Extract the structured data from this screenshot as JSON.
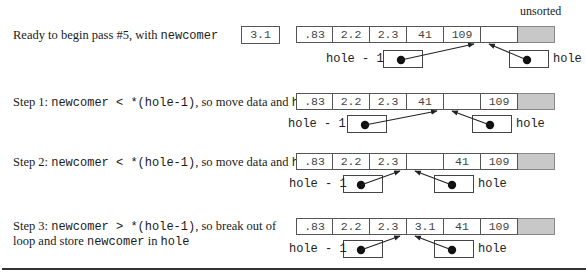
{
  "header": {
    "unsorted_label": "unsorted"
  },
  "newcomer_value": "3.1",
  "steps": [
    {
      "caption_parts": [
        {
          "text": "Ready to begin pass #5, with ",
          "mono": false
        },
        {
          "text": "newcomer",
          "mono": true
        }
      ],
      "caption_line2": [],
      "cells": [
        ".83",
        "2.2",
        "2.3",
        "41",
        "109",
        ""
      ],
      "hole_minus_1_label": "hole - 1",
      "hole_label": "hole",
      "hole_minus_1_target_index": 4,
      "hole_target_index": 5
    },
    {
      "caption_parts": [
        {
          "text": "Step 1: ",
          "mono": false
        },
        {
          "text": "newcomer < *(hole-1)",
          "mono": true
        },
        {
          "text": ", so move data and ",
          "mono": false
        },
        {
          "text": "hole",
          "mono": true
        }
      ],
      "caption_line2": [],
      "cells": [
        ".83",
        "2.2",
        "2.3",
        "41",
        "",
        "109"
      ],
      "hole_minus_1_label": "hole - 1",
      "hole_label": "hole",
      "hole_minus_1_target_index": 3,
      "hole_target_index": 4
    },
    {
      "caption_parts": [
        {
          "text": "Step 2: ",
          "mono": false
        },
        {
          "text": "newcomer < *(hole-1)",
          "mono": true
        },
        {
          "text": ", so move data and ",
          "mono": false
        },
        {
          "text": "hole",
          "mono": true
        }
      ],
      "caption_line2": [],
      "cells": [
        ".83",
        "2.2",
        "2.3",
        "",
        "41",
        "109"
      ],
      "hole_minus_1_label": "hole - 1",
      "hole_label": "hole",
      "hole_minus_1_target_index": 2,
      "hole_target_index": 3
    },
    {
      "caption_parts": [
        {
          "text": "Step 3: ",
          "mono": false
        },
        {
          "text": "newcomer > *(hole-1)",
          "mono": true
        },
        {
          "text": ", so break out of",
          "mono": false
        }
      ],
      "caption_line2": [
        {
          "text": "loop and store ",
          "mono": false
        },
        {
          "text": "newcomer",
          "mono": true
        },
        {
          "text": " in ",
          "mono": false
        },
        {
          "text": "hole",
          "mono": true
        }
      ],
      "cells": [
        ".83",
        "2.2",
        "2.3",
        "3.1",
        "41",
        "109"
      ],
      "hole_minus_1_label": "hole - 1",
      "hole_label": "hole",
      "hole_minus_1_target_index": 2,
      "hole_target_index": 3
    }
  ],
  "colors": {
    "shaded_unsorted": "#c8c8c8",
    "line": "#333333"
  }
}
